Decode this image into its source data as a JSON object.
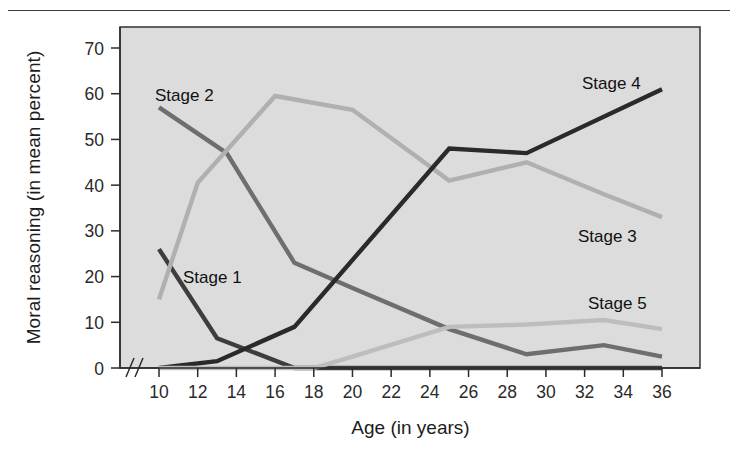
{
  "figure": {
    "has_top_rule": true,
    "background_color": "#ffffff",
    "plot_background_color": "#dcdcdc",
    "axis_break_symbol": "//"
  },
  "chart_data": {
    "type": "line",
    "title": "",
    "xlabel": "Age (in years)",
    "ylabel": "Moral reasoning (in mean percent)",
    "x": [
      10,
      12,
      14,
      16,
      18,
      20,
      22,
      24,
      26,
      28,
      30,
      32,
      34,
      36
    ],
    "xticks": [
      "10",
      "12",
      "14",
      "16",
      "18",
      "20",
      "22",
      "24",
      "26",
      "28",
      "30",
      "32",
      "34",
      "36"
    ],
    "yticks": [
      "0",
      "10",
      "20",
      "30",
      "40",
      "50",
      "60",
      "70"
    ],
    "xlim": [
      10,
      36
    ],
    "ylim": [
      0,
      75
    ],
    "grid": false,
    "legend_position": "inline-labels",
    "series": [
      {
        "name": "Stage 1",
        "color": "#3d3d3d",
        "label": "Stage 1",
        "label_x": 183,
        "label_y": 283,
        "points": [
          {
            "x": 10,
            "y": 26
          },
          {
            "x": 13,
            "y": 6.5
          },
          {
            "x": 17,
            "y": 0
          },
          {
            "x": 36,
            "y": 0
          }
        ]
      },
      {
        "name": "Stage 2",
        "color": "#6e6e6e",
        "label": "Stage 2",
        "label_x": 155,
        "label_y": 101,
        "points": [
          {
            "x": 10,
            "y": 57
          },
          {
            "x": 13.5,
            "y": 47
          },
          {
            "x": 17,
            "y": 23
          },
          {
            "x": 20,
            "y": 17.5
          },
          {
            "x": 25,
            "y": 8.5
          },
          {
            "x": 29,
            "y": 3
          },
          {
            "x": 33,
            "y": 5
          },
          {
            "x": 36,
            "y": 2.5
          }
        ]
      },
      {
        "name": "Stage 3",
        "color": "#b0b0b0",
        "label": "Stage 3",
        "label_x": 578,
        "label_y": 242,
        "points": [
          {
            "x": 10,
            "y": 15
          },
          {
            "x": 12,
            "y": 40.5
          },
          {
            "x": 16,
            "y": 59.5
          },
          {
            "x": 20,
            "y": 56.5
          },
          {
            "x": 25,
            "y": 41
          },
          {
            "x": 29,
            "y": 45
          },
          {
            "x": 33,
            "y": 38
          },
          {
            "x": 36,
            "y": 33
          }
        ]
      },
      {
        "name": "Stage 4",
        "color": "#2a2a2a",
        "label": "Stage 4",
        "label_x": 582,
        "label_y": 89,
        "points": [
          {
            "x": 10,
            "y": 0
          },
          {
            "x": 13,
            "y": 1.5
          },
          {
            "x": 17,
            "y": 9
          },
          {
            "x": 25,
            "y": 48
          },
          {
            "x": 29,
            "y": 47
          },
          {
            "x": 36,
            "y": 61
          }
        ]
      },
      {
        "name": "Stage 5",
        "color": "#bdbdbd",
        "label": "Stage 5",
        "label_x": 588,
        "label_y": 309,
        "points": [
          {
            "x": 10,
            "y": 0
          },
          {
            "x": 18,
            "y": 0
          },
          {
            "x": 20,
            "y": 2.5
          },
          {
            "x": 25,
            "y": 9
          },
          {
            "x": 29,
            "y": 9.5
          },
          {
            "x": 33,
            "y": 10.5
          },
          {
            "x": 36,
            "y": 8.5
          }
        ]
      }
    ]
  }
}
